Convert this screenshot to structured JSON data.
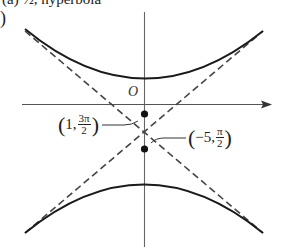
{
  "header": {
    "partial_text": "(a) ½, hyperbola",
    "part_paren": ")"
  },
  "figure": {
    "origin_label": "O",
    "point_upper": {
      "open": "(",
      "x": "1,",
      "num": "3π",
      "den": "2",
      "close": ")"
    },
    "point_lower": {
      "open": "(",
      "x": "−5,",
      "num": "π",
      "den": "2",
      "close": ")"
    },
    "colors": {
      "curve": "#1a1a1a",
      "axis": "#555555",
      "asymptote": "#444444"
    }
  }
}
